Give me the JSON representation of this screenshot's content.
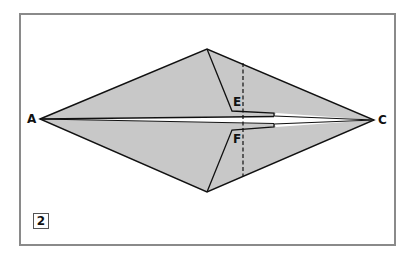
{
  "diagram": {
    "type": "origami-fold-step",
    "step_number": "2",
    "labels": {
      "a": "A",
      "c": "C",
      "e": "E",
      "f": "F"
    },
    "colors": {
      "paper_fill": "#c8c8c8",
      "line": "#111111",
      "frame_border": "#8a8a8a",
      "background": "#ffffff"
    },
    "points": {
      "A": [
        40,
        119
      ],
      "C": [
        374,
        120
      ],
      "top_vertex": [
        207,
        49
      ],
      "bottom_vertex": [
        207,
        192
      ],
      "E": [
        233,
        111
      ],
      "F": [
        232,
        130
      ]
    },
    "fold_line": {
      "style": "dashed",
      "x": 243,
      "y_start": 63,
      "y_end": 176
    }
  }
}
